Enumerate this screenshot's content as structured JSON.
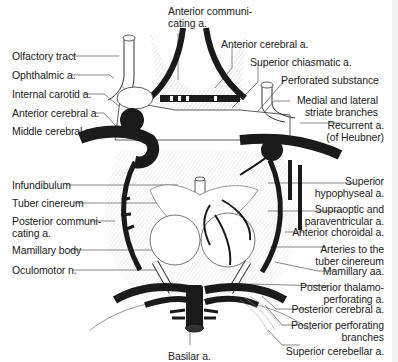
{
  "figure": {
    "labels": {
      "anterior_communicating": [
        "Anterior communi-",
        "cating a."
      ],
      "anterior_cerebral_right": "Anterior cerebral a.",
      "superior_chiasmatic": "Superior chiasmatic a.",
      "perforated_substance": "Perforated substance",
      "medial_lateral_striate": [
        "Medial and lateral",
        "striate branches"
      ],
      "recurrent": [
        "Recurrent a.",
        "(of Heubner)"
      ],
      "olfactory_tract": "Olfactory tract",
      "ophthalmic": "Ophthalmic a.",
      "internal_carotid": "Internal carotid a.",
      "anterior_cerebral_left": "Anterior cerebral a.",
      "middle_cerebral": "Middle cerebral a.",
      "infundibulum": "Infundibulum",
      "tuber_cinereum": "Tuber cinereum",
      "posterior_communicating": [
        "Posterior communi-",
        "cating a."
      ],
      "mamillary_body": "Mamillary body",
      "oculomotor": "Oculomotor n.",
      "superior_hypophyseal": [
        "Superior",
        "hypophyseal a."
      ],
      "supraoptic_paraventricular": [
        "Supraoptic and",
        "paraventricular a."
      ],
      "anterior_choroidal": "Anterior choroidal a.",
      "arteries_tuber_cinereum": [
        "Arteries to the",
        "tuber cinereum"
      ],
      "mamillary_aa": "Mamillary aa.",
      "posterior_thalamoperforating": [
        "Posterior thalamo-",
        "perforating a."
      ],
      "posterior_cerebral": "Posterior cerebral a.",
      "posterior_perforating": [
        "Posterior perforating",
        "branches"
      ],
      "superior_cerebellar": "Superior cerebellar a.",
      "basilar": "Basilar a."
    }
  }
}
